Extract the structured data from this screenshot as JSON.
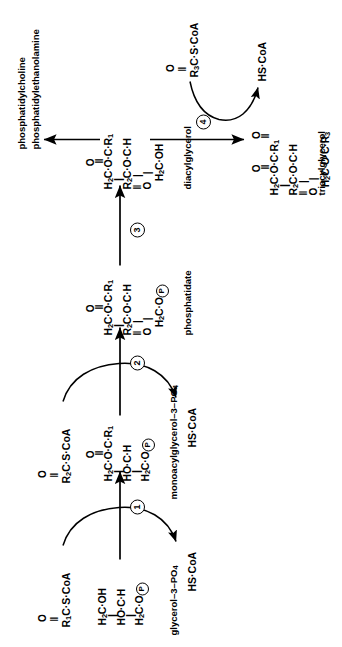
{
  "figure": {
    "orientation": "rotated-90-ccw",
    "line_color": "#000000",
    "background": "#ffffff"
  },
  "substrates": {
    "glycerol3p": {
      "caption": "glycerol-3-PO4",
      "caption_display": "glycerol–3–PO",
      "caption_sub": "4",
      "line1": "H2C·OH",
      "line2": "HO·C·H",
      "line3": "H2C·O"
    },
    "monoacylglycerol3p": {
      "caption_display": "monoacylglycerol–3–PO",
      "caption_sub": "4",
      "ocap": "O",
      "line1": "H2C·O·C·R1",
      "line2": "HO·C·H",
      "line3": "H2C·O"
    },
    "phosphatidate": {
      "caption_display": "phosphatidate",
      "ocap_top": "O",
      "line1": "H2C·O·C·R1",
      "line2": "R2C·O·C·H",
      "ocap_bottom": "O",
      "line3": "H2C·O"
    },
    "diacylglycerol": {
      "caption_display": "diacylglycerol",
      "ocap_top": "O",
      "line1": "H2C·O·C·R1",
      "line2": "R2C·O·C·H",
      "ocap_bottom": "O",
      "line3": "H2C·OH"
    },
    "triacylglycerol": {
      "caption_display": "triacylglycerol",
      "ocap_top": "O",
      "line1": "H2C·O·C·R1",
      "line2": "R2C·O·C·H",
      "ocap_bottom": "O",
      "ocap_right": "O",
      "line3": "H2C·O·C·R3"
    }
  },
  "reagents": {
    "acylcoa1": {
      "ocap": "O",
      "label": "R1C·S·CoA"
    },
    "acylcoa2": {
      "ocap": "O",
      "label": "R2C·S·CoA"
    },
    "acylcoa3": {
      "ocap": "O",
      "label": "R3C·S·CoA"
    },
    "hscoa1": {
      "label": "HS·CoA"
    },
    "hscoa2": {
      "label": "HS·CoA"
    },
    "hscoa4": {
      "label": "HS·CoA"
    }
  },
  "products": {
    "phosphatidylcholine": "phosphatidylcholine",
    "phosphatidylethanolamine": "phosphatidylethanolamine"
  },
  "steps": [
    {
      "id": "1",
      "label": "1"
    },
    {
      "id": "2",
      "label": "2"
    },
    {
      "id": "3",
      "label": "3"
    },
    {
      "id": "4",
      "label": "4"
    }
  ]
}
